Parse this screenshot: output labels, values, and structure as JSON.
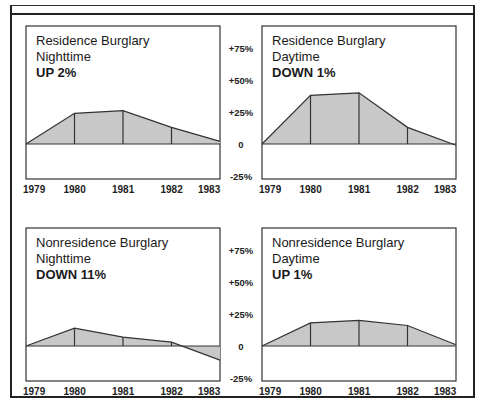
{
  "chart_data": [
    {
      "type": "area",
      "title": "Residence Burglary",
      "subtitle": "Nighttime",
      "status": "UP 2%",
      "categories": [
        "1979",
        "1980",
        "1981",
        "1982",
        "1983"
      ],
      "values": [
        0,
        24,
        26,
        13,
        2
      ],
      "ylabel": "Percent change from 1979",
      "ylim": [
        -25,
        75
      ],
      "yticks": [
        "+75%",
        "+50%",
        "+25%",
        "0",
        "-25%"
      ],
      "grid": false
    },
    {
      "type": "area",
      "title": "Residence Burglary",
      "subtitle": "Daytime",
      "status": "DOWN 1%",
      "categories": [
        "1979",
        "1980",
        "1981",
        "1982",
        "1983"
      ],
      "values": [
        0,
        38,
        40,
        13,
        -1
      ],
      "ylabel": "Percent change from 1979",
      "ylim": [
        -25,
        75
      ],
      "yticks": [
        "+75%",
        "+50%",
        "+25%",
        "0",
        "-25%"
      ],
      "grid": false
    },
    {
      "type": "area",
      "title": "Nonresidence Burglary",
      "subtitle": "Nighttime",
      "status": "DOWN 11%",
      "categories": [
        "1979",
        "1980",
        "1981",
        "1982",
        "1983"
      ],
      "values": [
        0,
        14,
        7,
        3,
        -11
      ],
      "ylabel": "Percent change from 1979",
      "ylim": [
        -25,
        75
      ],
      "yticks": [
        "+75%",
        "+50%",
        "+25%",
        "0",
        "-25%"
      ],
      "grid": false
    },
    {
      "type": "area",
      "title": "Nonresidence Burglary",
      "subtitle": "Daytime",
      "status": "UP 1%",
      "categories": [
        "1979",
        "1980",
        "1981",
        "1982",
        "1983"
      ],
      "values": [
        0,
        18,
        20,
        16,
        1
      ],
      "ylabel": "Percent change from 1979",
      "ylim": [
        -25,
        75
      ],
      "yticks": [
        "+75%",
        "+50%",
        "+25%",
        "0",
        "-25%"
      ],
      "grid": false
    }
  ],
  "panels": [
    {
      "title": "Residence Burglary",
      "subtitle": "Nighttime",
      "status": "UP 2%"
    },
    {
      "title": "Residence Burglary",
      "subtitle": "Daytime",
      "status": "DOWN 1%"
    },
    {
      "title": "Nonresidence Burglary",
      "subtitle": "Nighttime",
      "status": "DOWN 11%"
    },
    {
      "title": "Nonresidence Burglary",
      "subtitle": "Daytime",
      "status": "UP 1%"
    }
  ],
  "axis": {
    "years": [
      "1979",
      "1980",
      "1981",
      "1982",
      "1983"
    ],
    "yticks": [
      "+75%",
      "+50%",
      "+25%",
      "0",
      "-25%"
    ]
  },
  "colors": {
    "fill": "#c8c8c8",
    "line": "#333333",
    "frame": "#333333"
  }
}
